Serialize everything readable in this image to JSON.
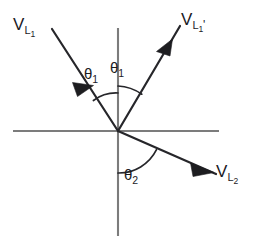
{
  "figure": {
    "background_color": "#ffffff",
    "axis_color": "#7c7c7c",
    "vector_color": "#26262a",
    "text_color": "#1b1b1f"
  },
  "axes": {
    "origin": {
      "x": 118,
      "y": 131
    },
    "horizontal": {
      "x1": 13,
      "y1": 131,
      "x2": 219,
      "y2": 131,
      "label": "horizontal-axis"
    },
    "vertical": {
      "x1": 118,
      "y1": 28,
      "x2": 118,
      "y2": 236,
      "label": "vertical-axis"
    }
  },
  "vectors": [
    {
      "id": "v-l1",
      "base": "V",
      "subscript": "L",
      "subsubscript": "1",
      "prime": "",
      "label_text": "V_L1",
      "direction": "incoming-from-upper-left",
      "start": {
        "x": 52,
        "y": 29
      },
      "end": {
        "x": 118,
        "y": 131
      },
      "arrow_at": 0.42
    },
    {
      "id": "v-l1-prime",
      "base": "V",
      "subscript": "L",
      "subsubscript": "1",
      "prime": "'",
      "label_text": "V_L1'",
      "direction": "outgoing-to-upper-right",
      "start": {
        "x": 118,
        "y": 131
      },
      "end": {
        "x": 180,
        "y": 26
      },
      "arrow_at": 0.78
    },
    {
      "id": "v-l2",
      "base": "V",
      "subscript": "L",
      "subsubscript": "2",
      "prime": "",
      "label_text": "V_L2",
      "direction": "outgoing-to-lower-right",
      "start": {
        "x": 118,
        "y": 131
      },
      "end": {
        "x": 216,
        "y": 174
      },
      "arrow_at": 0.86
    }
  ],
  "angles": [
    {
      "id": "theta1-left",
      "symbol": "θ",
      "subscript": "1",
      "label_text": "θ1",
      "between": [
        "v-l1",
        "vertical-axis-up"
      ],
      "radius": 38
    },
    {
      "id": "theta1-right",
      "symbol": "θ",
      "subscript": "1",
      "label_text": "θ1",
      "between": [
        "vertical-axis-up",
        "v-l1-prime"
      ],
      "radius": 45
    },
    {
      "id": "theta2",
      "symbol": "θ",
      "subscript": "2",
      "label_text": "θ2",
      "between": [
        "vertical-axis-down",
        "v-l2"
      ],
      "radius": 42
    }
  ],
  "labels": {
    "v_l1": {
      "base": "V",
      "sub": "L",
      "subsub": "1",
      "prime": ""
    },
    "v_l1_prime": {
      "base": "V",
      "sub": "L",
      "subsub": "1",
      "prime": "'"
    },
    "v_l2": {
      "base": "V",
      "sub": "L",
      "subsub": "2",
      "prime": ""
    },
    "theta1_left": {
      "symbol": "θ",
      "sub": "1"
    },
    "theta1_right": {
      "symbol": "θ",
      "sub": "1"
    },
    "theta2": {
      "symbol": "θ",
      "sub": "2"
    }
  }
}
